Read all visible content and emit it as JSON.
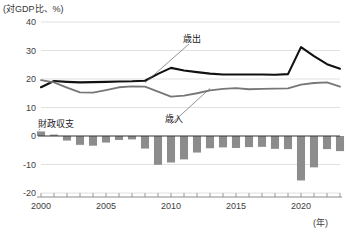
{
  "chart_data": {
    "type": "bar",
    "title": "(対GDP比、%)",
    "xlabel": "(年)",
    "ylabel": "",
    "ylim": [
      -20,
      40
    ],
    "xlim": [
      2000,
      2023
    ],
    "ytick_labels": [
      "40",
      "30",
      "20",
      "10",
      "0",
      "-10",
      "-20"
    ],
    "ytick_values": [
      40,
      30,
      20,
      10,
      0,
      -10,
      -20
    ],
    "xtick_labels": [
      "2000",
      "2005",
      "2010",
      "2015",
      "2020"
    ],
    "xtick_values": [
      2000,
      2005,
      2010,
      2015,
      2020
    ],
    "grid": true,
    "legend_position": "inline-annotations",
    "x": [
      2000,
      2001,
      2002,
      2003,
      2004,
      2005,
      2006,
      2007,
      2008,
      2009,
      2010,
      2011,
      2012,
      2013,
      2014,
      2015,
      2016,
      2017,
      2018,
      2019,
      2020,
      2021,
      2022,
      2023
    ],
    "series": [
      {
        "name": "歳出",
        "type": "line",
        "color": "#111111",
        "values": [
          17.1,
          19.3,
          19.0,
          18.8,
          18.9,
          19.0,
          19.1,
          19.2,
          19.4,
          21.8,
          23.9,
          23.0,
          22.4,
          21.9,
          21.6,
          21.6,
          21.6,
          21.6,
          21.5,
          21.7,
          31.2,
          28.0,
          25.2,
          23.6
        ]
      },
      {
        "name": "歳入",
        "type": "line",
        "color": "#777777",
        "values": [
          19.6,
          18.8,
          17.0,
          15.3,
          15.2,
          16.1,
          17.1,
          17.4,
          17.3,
          15.6,
          13.8,
          14.2,
          15.0,
          16.0,
          16.5,
          16.8,
          16.4,
          16.5,
          16.6,
          16.7,
          18.0,
          18.6,
          18.8,
          17.3
        ]
      },
      {
        "name": "財政収支",
        "type": "bar",
        "color": "#8c8c8c",
        "values": [
          1.6,
          0.5,
          -1.6,
          -3.1,
          -3.4,
          -2.3,
          -1.4,
          -1.2,
          -4.4,
          -10.1,
          -9.3,
          -8.2,
          -5.8,
          -4.3,
          -4.0,
          -4.2,
          -3.9,
          -3.8,
          -4.5,
          -4.6,
          -15.6,
          -11.0,
          -4.6,
          -5.3
        ]
      }
    ],
    "annotations": [
      {
        "text": "歳出",
        "target_year": 2008
      },
      {
        "text": "歳入",
        "target_year": 2013
      },
      {
        "text": "財政収支",
        "target_year": 2000
      }
    ]
  }
}
